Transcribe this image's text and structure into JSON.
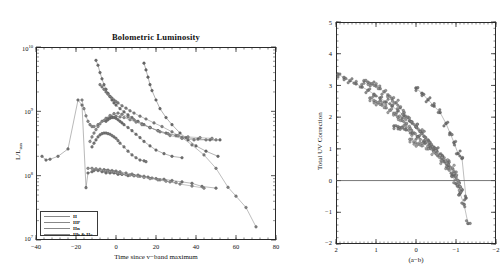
{
  "figure": {
    "panels": [
      "left",
      "right"
    ],
    "background": "#ffffff",
    "ink": "#2b2b2b"
  },
  "left_panel": {
    "title": "Bolometric Luminosity",
    "xlabel": "Time since v−band maximum",
    "ylabel_num": "L/L",
    "ylabel_sub": "sun",
    "xticks": [
      "−40",
      "−20",
      "0",
      "20",
      "40",
      "60",
      "80"
    ],
    "yticks": [
      "10",
      "10",
      "10",
      "10"
    ],
    "yexps": [
      "10",
      "9",
      "8",
      "7"
    ],
    "legend": {
      "items": [
        {
          "label": "II",
          "color": "#8e8e8e"
        },
        {
          "label": "IIP",
          "color": "#9a9a9a"
        },
        {
          "label": "IIn",
          "color": "#8a8a8a"
        },
        {
          "label": "IIb & IIc",
          "color": "#7d7d7d"
        }
      ]
    }
  },
  "right_panel": {
    "title": "",
    "xlabel": "(a−b)",
    "ylabel": "Total UV Correction",
    "xticks": [
      "2",
      "1",
      "0",
      "−1",
      "−2"
    ],
    "yticks": [
      "5",
      "4",
      "3",
      "2",
      "1",
      "0",
      "−1",
      "−2"
    ],
    "zero_line": "0"
  },
  "chart_data": [
    {
      "type": "line",
      "panel": "left",
      "title": "Bolometric Luminosity",
      "xlabel": "Time since v−band maximum",
      "ylabel": "L/L_sun",
      "xlim": [
        -40,
        80
      ],
      "ylim": [
        10000000.0,
        10000000000.0
      ],
      "yscale": "log",
      "grid": false,
      "legend_position": "lower-left",
      "legend_entries": [
        "II",
        "IIP",
        "IIn",
        "IIb & IIc"
      ],
      "series": [
        {
          "name": "sn-a",
          "color": "#777777",
          "x": [
            -37,
            -35,
            -33,
            -29,
            -24,
            -19,
            -17,
            -15,
            -14,
            -12,
            -11,
            -9,
            -7,
            -5,
            -3,
            -1,
            1,
            3,
            6,
            9,
            12,
            16,
            20,
            24,
            28,
            33,
            38,
            43,
            50
          ],
          "y": [
            200000000.0,
            175000000.0,
            180000000.0,
            200000000.0,
            260000000.0,
            1500000000.0,
            1250000000.0,
            65000000.0,
            110000000.0,
            115000000.0,
            120000000.0,
            120000000.0,
            115000000.0,
            110000000.0,
            110000000.0,
            110000000.0,
            105000000.0,
            105000000.0,
            100000000.0,
            100000000.0,
            98000000.0,
            95000000.0,
            90000000.0,
            88000000.0,
            84000000.0,
            80000000.0,
            76000000.0,
            68000000.0,
            64000000.0
          ]
        },
        {
          "name": "sn-b",
          "color": "#6e6e6e",
          "x": [
            -10,
            -9,
            -8,
            -7,
            -6,
            -5,
            -4,
            -3,
            -2,
            -1,
            0,
            2,
            4,
            6,
            8,
            11,
            14,
            17,
            21,
            25,
            30,
            35,
            41,
            47,
            52
          ],
          "y": [
            6200000000.0,
            5200000000.0,
            4000000000.0,
            3200000000.0,
            2600000000.0,
            2200000000.0,
            1900000000.0,
            1700000000.0,
            1500000000.0,
            1350000000.0,
            1250000000.0,
            1100000000.0,
            980000000.0,
            880000000.0,
            800000000.0,
            700000000.0,
            620000000.0,
            560000000.0,
            500000000.0,
            460000000.0,
            420000000.0,
            390000000.0,
            370000000.0,
            360000000.0,
            360000000.0
          ]
        },
        {
          "name": "sn-c",
          "color": "#828282",
          "x": [
            -8,
            -7,
            -6,
            -5,
            -4,
            -3,
            -2,
            -1,
            0,
            1,
            3,
            5,
            7,
            9,
            12,
            15,
            19,
            23,
            28,
            33,
            38,
            44,
            50,
            56,
            60,
            65,
            70
          ],
          "y": [
            2600000000.0,
            2400000000.0,
            2200000000.0,
            2000000000.0,
            1850000000.0,
            1700000000.0,
            1600000000.0,
            1500000000.0,
            1420000000.0,
            1350000000.0,
            1220000000.0,
            1120000000.0,
            1020000000.0,
            940000000.0,
            840000000.0,
            760000000.0,
            660000000.0,
            580000000.0,
            480000000.0,
            390000000.0,
            300000000.0,
            210000000.0,
            130000000.0,
            66000000.0,
            48000000.0,
            32000000.0,
            16000000.0
          ]
        },
        {
          "name": "sn-d",
          "color": "#6a6a6a",
          "x": [
            14,
            15,
            16,
            17,
            18,
            20,
            22,
            25,
            28,
            32,
            36,
            40,
            45,
            51
          ],
          "y": [
            5600000000.0,
            4400000000.0,
            3400000000.0,
            2600000000.0,
            2100000000.0,
            1500000000.0,
            1100000000.0,
            800000000.0,
            620000000.0,
            460000000.0,
            360000000.0,
            290000000.0,
            240000000.0,
            200000000.0
          ]
        },
        {
          "name": "sn-e",
          "color": "#8a8a8a",
          "x": [
            -17,
            -16,
            -15,
            -14,
            -13,
            -12,
            -11,
            -9,
            -7,
            -5,
            -3,
            -1,
            1,
            3,
            6,
            9,
            13,
            17,
            22,
            27,
            33,
            39,
            45,
            50
          ],
          "y": [
            1500000000.0,
            1100000000.0,
            850000000.0,
            700000000.0,
            620000000.0,
            580000000.0,
            580000000.0,
            620000000.0,
            700000000.0,
            780000000.0,
            860000000.0,
            920000000.0,
            940000000.0,
            900000000.0,
            820000000.0,
            740000000.0,
            640000000.0,
            560000000.0,
            480000000.0,
            420000000.0,
            380000000.0,
            360000000.0,
            360000000.0,
            360000000.0
          ]
        },
        {
          "name": "sn-f",
          "color": "#909090",
          "x": [
            -13,
            -12,
            -11,
            -10,
            -9,
            -8,
            -6,
            -4,
            -2,
            0,
            2,
            4,
            7,
            10,
            13,
            17,
            21,
            26,
            31,
            36,
            42,
            48
          ],
          "y": [
            340000000.0,
            400000000.0,
            460000000.0,
            520000000.0,
            580000000.0,
            640000000.0,
            720000000.0,
            780000000.0,
            820000000.0,
            840000000.0,
            820000000.0,
            800000000.0,
            740000000.0,
            680000000.0,
            620000000.0,
            560000000.0,
            500000000.0,
            450000000.0,
            420000000.0,
            400000000.0,
            390000000.0,
            380000000.0
          ]
        },
        {
          "name": "sn-g",
          "color": "#7a7a7a",
          "x": [
            -12,
            -11,
            -10,
            -9,
            -8,
            -7,
            -6,
            -5,
            -4,
            -3,
            -2,
            -1,
            0,
            1,
            2,
            4,
            6,
            8,
            10,
            12,
            14,
            15
          ],
          "y": [
            280000000.0,
            320000000.0,
            360000000.0,
            400000000.0,
            430000000.0,
            450000000.0,
            460000000.0,
            460000000.0,
            450000000.0,
            440000000.0,
            420000000.0,
            400000000.0,
            380000000.0,
            350000000.0,
            320000000.0,
            280000000.0,
            240000000.0,
            210000000.0,
            190000000.0,
            175000000.0,
            170000000.0,
            165000000.0
          ]
        },
        {
          "name": "sn-h",
          "color": "#8e8e8e",
          "x": [
            -14,
            -12,
            -10,
            -8,
            -6,
            -4,
            -2,
            0,
            2,
            5,
            8,
            11,
            14,
            18,
            22,
            27,
            32,
            38,
            44
          ],
          "y": [
            130000000.0,
            130000000.0,
            128000000.0,
            126000000.0,
            124000000.0,
            122000000.0,
            120000000.0,
            118000000.0,
            115000000.0,
            110000000.0,
            106000000.0,
            102000000.0,
            98000000.0,
            92000000.0,
            86000000.0,
            80000000.0,
            74000000.0,
            69000000.0,
            64000000.0
          ]
        },
        {
          "name": "sn-i",
          "color": "#999999",
          "x": [
            -6,
            -5,
            -4,
            -3,
            -2,
            -1,
            0,
            1,
            2,
            3,
            5,
            7,
            9,
            11,
            14,
            17,
            21,
            25,
            30
          ],
          "y": [
            120000000.0,
            120000000.0,
            118000000.0,
            116000000.0,
            115000000.0,
            114000000.0,
            112000000.0,
            110000000.0,
            108000000.0,
            106000000.0,
            104000000.0,
            102000000.0,
            100000000.0,
            98000000.0,
            94000000.0,
            90000000.0,
            86000000.0,
            82000000.0,
            78000000.0
          ]
        },
        {
          "name": "sn-j",
          "color": "#6f6f6f",
          "x": [
            -5,
            -4,
            -3,
            -2,
            -1,
            0,
            1,
            2,
            3,
            4,
            6,
            8,
            10,
            12,
            14,
            17,
            20,
            24,
            28,
            33
          ],
          "y": [
            700000000.0,
            740000000.0,
            780000000.0,
            800000000.0,
            800000000.0,
            780000000.0,
            740000000.0,
            700000000.0,
            660000000.0,
            620000000.0,
            560000000.0,
            500000000.0,
            440000000.0,
            390000000.0,
            340000000.0,
            290000000.0,
            250000000.0,
            220000000.0,
            200000000.0,
            190000000.0
          ]
        }
      ]
    },
    {
      "type": "scatter",
      "panel": "right",
      "title": "",
      "xlabel": "(a−b)",
      "ylabel": "Total UV Correction",
      "xlim": [
        2,
        -2
      ],
      "ylim": [
        -2,
        5
      ],
      "grid": false,
      "reference_lines": [
        {
          "axis": "y",
          "value": 0
        }
      ],
      "series": [
        {
          "name": "track-1",
          "color": "#7a7a7a",
          "x": [
            1.95,
            1.8,
            1.65,
            1.5,
            1.35,
            1.2,
            1.05,
            0.9,
            0.75,
            0.6,
            0.45,
            0.3,
            0.15,
            0.0,
            -0.15,
            -0.3,
            -0.45,
            -0.6,
            -0.7,
            -0.8,
            -0.9,
            -1.0,
            -1.1,
            -1.2,
            -1.3
          ],
          "y": [
            3.35,
            3.25,
            3.15,
            3.05,
            2.95,
            2.85,
            2.72,
            2.6,
            2.48,
            2.35,
            2.2,
            2.05,
            1.88,
            1.7,
            1.5,
            1.28,
            1.05,
            0.8,
            0.6,
            0.4,
            0.15,
            -0.1,
            -0.4,
            -0.75,
            -1.35
          ]
        },
        {
          "name": "track-2",
          "color": "#868686",
          "x": [
            1.3,
            1.2,
            1.1,
            1.0,
            0.9,
            0.8,
            0.7,
            0.6,
            0.5,
            0.4,
            0.3,
            0.2,
            0.1,
            0.0,
            -0.1,
            -0.2,
            -0.35,
            -0.5,
            -0.65,
            -0.8,
            -0.95,
            -1.05,
            -1.15
          ],
          "y": [
            3.15,
            3.1,
            3.05,
            2.98,
            2.9,
            2.8,
            2.7,
            2.58,
            2.45,
            2.3,
            2.15,
            2.0,
            1.85,
            1.7,
            1.55,
            1.4,
            1.2,
            1.0,
            0.78,
            0.55,
            0.28,
            0.0,
            -0.3
          ]
        },
        {
          "name": "track-3",
          "color": "#909090",
          "x": [
            1.15,
            1.05,
            0.95,
            0.85,
            0.75,
            0.65,
            0.55,
            0.45,
            0.35,
            0.25,
            0.15,
            0.05,
            -0.05,
            -0.2,
            -0.35,
            -0.5,
            -0.65,
            -0.8,
            -0.95,
            -1.05
          ],
          "y": [
            2.6,
            2.52,
            2.45,
            2.38,
            2.3,
            2.22,
            2.12,
            2.0,
            1.9,
            1.78,
            1.65,
            1.5,
            1.38,
            1.2,
            1.02,
            0.85,
            0.62,
            0.4,
            0.15,
            -0.12
          ]
        },
        {
          "name": "track-4",
          "color": "#6e6e6e",
          "x": [
            0.0,
            -0.15,
            -0.3,
            -0.45,
            -0.6,
            -0.75,
            -0.85,
            -0.95,
            -1.05,
            -1.15,
            -1.25
          ],
          "y": [
            2.92,
            2.75,
            2.55,
            2.35,
            2.15,
            1.8,
            1.5,
            1.2,
            0.85,
            0.7,
            -0.55
          ]
        },
        {
          "name": "track-5",
          "color": "#7d7d7d",
          "x": [
            0.55,
            0.45,
            0.35,
            0.25,
            0.1,
            -0.05,
            -0.2,
            -0.35,
            -0.5,
            -0.65,
            -0.8,
            -0.95,
            -1.1
          ],
          "y": [
            1.72,
            1.7,
            1.68,
            1.6,
            1.5,
            1.38,
            1.25,
            1.1,
            0.95,
            0.75,
            0.5,
            0.2,
            -0.2
          ]
        },
        {
          "name": "track-6",
          "color": "#999999",
          "x": [
            0.15,
            0.05,
            -0.05,
            -0.15,
            -0.3,
            -0.45,
            -0.6,
            -0.75,
            -0.9,
            -1.0,
            -1.12
          ],
          "y": [
            1.3,
            1.22,
            1.15,
            1.1,
            1.0,
            0.9,
            0.78,
            0.62,
            0.4,
            0.15,
            -0.25
          ]
        }
      ]
    }
  ]
}
